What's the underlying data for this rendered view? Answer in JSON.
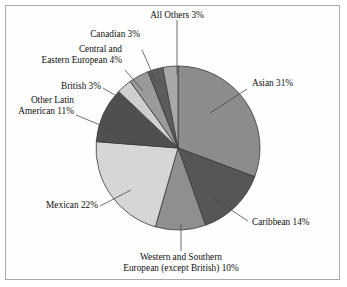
{
  "chart_data": {
    "type": "pie",
    "title": "",
    "subtitle": "",
    "xlabel": "",
    "ylabel": "",
    "legend_position": "none",
    "grid": false,
    "start_angle_deg": 0,
    "direction": "clockwise",
    "units": "percent",
    "categories": [
      "Asian",
      "Caribbean",
      "Western and Southern European (except British)",
      "Mexican",
      "Other Latin American",
      "British",
      "Central and Eastern European",
      "Canadian",
      "All Others"
    ],
    "values": [
      31,
      14,
      10,
      22,
      11,
      3,
      4,
      3,
      3
    ],
    "slice_colors": [
      "#8c8c8c",
      "#565656",
      "#8f8f8f",
      "#d6d6d6",
      "#4f4f4f",
      "#cfcfcf",
      "#9a9a9a",
      "#5c5c5c",
      "#a8a8a8"
    ],
    "labels": [
      {
        "text": "Asian 31%",
        "value": 31
      },
      {
        "text": "Caribbean 14%",
        "value": 14
      },
      {
        "text": "Western and Southern",
        "text2": "European (except British) 10%",
        "value": 10
      },
      {
        "text": "Mexican 22%",
        "value": 22
      },
      {
        "text": "Other Latin",
        "text2": "American 11%",
        "value": 11
      },
      {
        "text": "British 3%",
        "value": 3
      },
      {
        "text": "Central and",
        "text2": "Eastern European 4%",
        "value": 4
      },
      {
        "text": "Canadian 3%",
        "value": 3
      },
      {
        "text": "All Others 3%",
        "value": 3
      }
    ]
  },
  "style": {
    "border_color": "#a9a9a9",
    "background": "#ffffff",
    "outline_color": "#3a3a3a",
    "leader_color": "#4a4a4a"
  }
}
